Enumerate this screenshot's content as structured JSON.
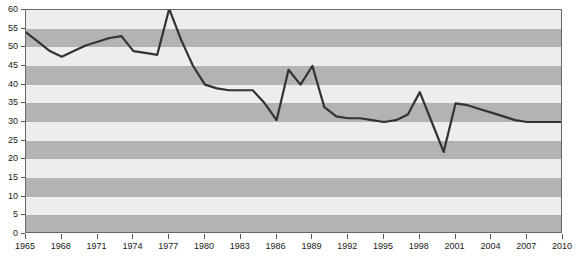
{
  "chart_data": {
    "type": "line",
    "title": "",
    "subtitle": "",
    "xlabel": "",
    "ylabel": "",
    "xlim": [
      1965,
      2010
    ],
    "ylim": [
      0,
      60
    ],
    "grid": "horizontal-alternating-bands",
    "legend": "none",
    "y_ticks": [
      0,
      5,
      10,
      15,
      20,
      25,
      30,
      35,
      40,
      45,
      50,
      55,
      60
    ],
    "x_ticks": [
      1965,
      1968,
      1971,
      1974,
      1977,
      1980,
      1983,
      1986,
      1989,
      1992,
      1995,
      1998,
      2001,
      2004,
      2007,
      2010
    ],
    "series": [
      {
        "name": "series-1",
        "color": "#333333",
        "x": [
          1965,
          1966,
          1967,
          1968,
          1969,
          1970,
          1971,
          1972,
          1973,
          1974,
          1975,
          1976,
          1977,
          1978,
          1979,
          1980,
          1981,
          1982,
          1983,
          1984,
          1985,
          1986,
          1987,
          1988,
          1989,
          1990,
          1991,
          1992,
          1993,
          1994,
          1995,
          1996,
          1997,
          1998,
          1999,
          2000,
          2001,
          2002,
          2003,
          2004,
          2005,
          2006,
          2007,
          2008,
          2009,
          2010
        ],
        "values": [
          54.0,
          51.5,
          49.0,
          47.5,
          49.0,
          50.5,
          51.5,
          52.5,
          53.0,
          49.0,
          48.5,
          48.0,
          60.3,
          52.0,
          45.0,
          40.0,
          39.0,
          38.5,
          38.5,
          38.5,
          35.0,
          30.5,
          44.0,
          40.0,
          45.0,
          34.0,
          31.5,
          31.0,
          31.0,
          30.5,
          30.0,
          30.5,
          32.0,
          38.0,
          30.0,
          22.0,
          35.0,
          34.5,
          33.5,
          32.5,
          31.5,
          30.5,
          30.0,
          30.0,
          30.0,
          30.0
        ]
      }
    ]
  },
  "axes": {
    "y_tick_labels": [
      "0",
      "5",
      "10",
      "15",
      "20",
      "25",
      "30",
      "35",
      "40",
      "45",
      "50",
      "55",
      "60"
    ],
    "x_tick_labels": [
      "1965",
      "1968",
      "1971",
      "1974",
      "1977",
      "1980",
      "1983",
      "1986",
      "1989",
      "1992",
      "1995",
      "1998",
      "2001",
      "2004",
      "2007",
      "2010"
    ]
  },
  "style": {
    "band_light": "#ededed",
    "band_dark": "#b3b3b3",
    "line_color": "#333333",
    "frame_color": "#666666",
    "tick_color": "#555555",
    "text_color": "#1a1a1a",
    "background": "#ffffff"
  }
}
